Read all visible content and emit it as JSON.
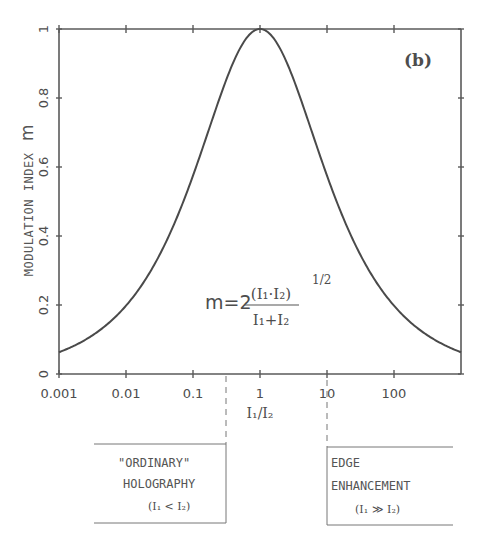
{
  "chart_data": {
    "type": "line",
    "panel_label": "(b)",
    "title": "",
    "xlabel": "I1/I2",
    "ylabel": "MODULATION INDEX m",
    "xscale": "log",
    "xlim": [
      0.001,
      1000
    ],
    "ylim": [
      0,
      1
    ],
    "x_ticks": [
      "0.001",
      "0.01",
      "0.1",
      "1",
      "10",
      "100"
    ],
    "y_ticks": [
      "0",
      "0.2",
      "0.4",
      "0.6",
      "0.8",
      "1"
    ],
    "grid": false,
    "formula": "m = 2 (I1·I2)^(1/2) / (I1+I2)",
    "series": [
      {
        "name": "m",
        "x": [
          0.001,
          0.003,
          0.01,
          0.03,
          0.1,
          0.3,
          1,
          3,
          10,
          30,
          100,
          300,
          1000
        ],
        "values": [
          0.063,
          0.109,
          0.198,
          0.336,
          0.575,
          0.843,
          1.0,
          0.866,
          0.575,
          0.354,
          0.198,
          0.115,
          0.063
        ]
      }
    ],
    "annotations": [
      {
        "text": "\"ORDINARY\" HOLOGRAPHY (I1 < I2)",
        "region": "left of dashed line near I1/I2 ≈ 0.3"
      },
      {
        "text": "EDGE ENHANCEMENT (I1 ≫ I2)",
        "region": "right of dashed line at I1/I2 = 10"
      }
    ]
  },
  "labels": {
    "panel": "(b)",
    "ylabel_main": "MODULATION INDEX",
    "ylabel_var": "m",
    "xlabel": "I₁/I₂",
    "x_ticks": [
      "0.001",
      "0.01",
      "0.1",
      "1",
      "10",
      "100"
    ],
    "y_ticks": [
      "0",
      "0.2",
      "0.4",
      "0.6",
      "0.8",
      "1"
    ],
    "formula_lhs": "m=2",
    "formula_num": "(I₁·I₂)",
    "formula_exp": "1/2",
    "formula_den": "I₁+I₂",
    "box_left_line1": "\"ORDINARY\"",
    "box_left_line2": "HOLOGRAPHY",
    "box_left_line3": "(I₁ < I₂)",
    "box_right_line1": "EDGE",
    "box_right_line2": "ENHANCEMENT",
    "box_right_line3": "(I₁ ≫ I₂)"
  }
}
